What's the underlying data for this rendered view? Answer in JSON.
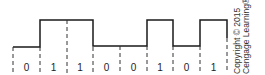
{
  "diagram": {
    "type": "digital-signal-waveform",
    "bits": [
      "0",
      "1",
      "1",
      "0",
      "0",
      "1",
      "0",
      "1"
    ],
    "colors": {
      "line": "#1a1a1a",
      "dashed": "#333333",
      "text": "#222222"
    },
    "copyright_line1": "Copyright © 2015",
    "copyright_line2": "Cengage Learning®"
  }
}
